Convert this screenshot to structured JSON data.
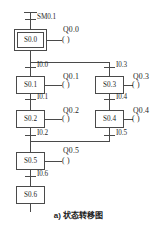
{
  "diagram": {
    "title_caption": "a) 状态转移图",
    "type": "plc-state-transition-diagram",
    "line_color": "#4a4a4a",
    "box_fill": "#ffffff",
    "text_color": "#1d1d1d",
    "background": "#ffffff",
    "states": [
      {
        "id": "s00",
        "label": "S0.0",
        "initial": true,
        "x": 14,
        "y": 29,
        "w": 33,
        "h": 22
      },
      {
        "id": "s01",
        "label": "S0.1",
        "initial": false,
        "x": 16,
        "y": 76,
        "w": 29,
        "h": 18
      },
      {
        "id": "s02",
        "label": "S0.2",
        "initial": false,
        "x": 16,
        "y": 110,
        "w": 29,
        "h": 18
      },
      {
        "id": "s05",
        "label": "S0.5",
        "initial": false,
        "x": 16,
        "y": 152,
        "w": 29,
        "h": 18
      },
      {
        "id": "s06",
        "label": "S0.6",
        "initial": false,
        "x": 16,
        "y": 186,
        "w": 29,
        "h": 18
      },
      {
        "id": "s03",
        "label": "S0.3",
        "initial": false,
        "x": 95,
        "y": 76,
        "w": 29,
        "h": 18
      },
      {
        "id": "s04",
        "label": "S0.4",
        "initial": false,
        "x": 95,
        "y": 110,
        "w": 29,
        "h": 18
      }
    ],
    "transitions": [
      {
        "id": "t_sm01",
        "label": "SM0.1",
        "x": 35,
        "y": 15
      },
      {
        "id": "t_i00",
        "label": "I0.0",
        "x": 35,
        "y": 67
      },
      {
        "id": "t_i01",
        "label": "I0.1",
        "x": 35,
        "y": 99
      },
      {
        "id": "t_i02",
        "label": "I0.2",
        "x": 35,
        "y": 135
      },
      {
        "id": "t_i06",
        "label": "I0.6",
        "x": 35,
        "y": 176
      },
      {
        "id": "t_i03",
        "label": "I0.3",
        "x": 113,
        "y": 67
      },
      {
        "id": "t_i04",
        "label": "I0.4",
        "x": 113,
        "y": 99
      },
      {
        "id": "t_i05",
        "label": "I0.5",
        "x": 113,
        "y": 135
      }
    ],
    "coils": [
      {
        "id": "q00",
        "label": "Q0.0",
        "state": "S0.0",
        "lx": 62,
        "ly": 27,
        "cx": 69,
        "cy": 40
      },
      {
        "id": "q01",
        "label": "Q0.1",
        "state": "S0.1",
        "lx": 62,
        "ly": 74,
        "cx": 69,
        "cy": 86
      },
      {
        "id": "q02",
        "label": "Q0.2",
        "state": "S0.2",
        "lx": 62,
        "ly": 108,
        "cx": 69,
        "cy": 120
      },
      {
        "id": "q05",
        "label": "Q0.5",
        "state": "S0.5",
        "lx": 62,
        "ly": 146,
        "cx": 69,
        "cy": 162
      },
      {
        "id": "q03",
        "label": "Q0.3",
        "state": "S0.3",
        "lx": 131,
        "ly": 74,
        "cx": 139,
        "cy": 86
      },
      {
        "id": "q04",
        "label": "Q0.4",
        "state": "S0.4",
        "lx": 131,
        "ly": 108,
        "cx": 139,
        "cy": 120
      }
    ],
    "coil_symbol": "( )",
    "branch_lines": {
      "divergence_y": 62,
      "convergence_y": 141,
      "left_rail_x": 30,
      "right_rail_x": 109
    }
  }
}
